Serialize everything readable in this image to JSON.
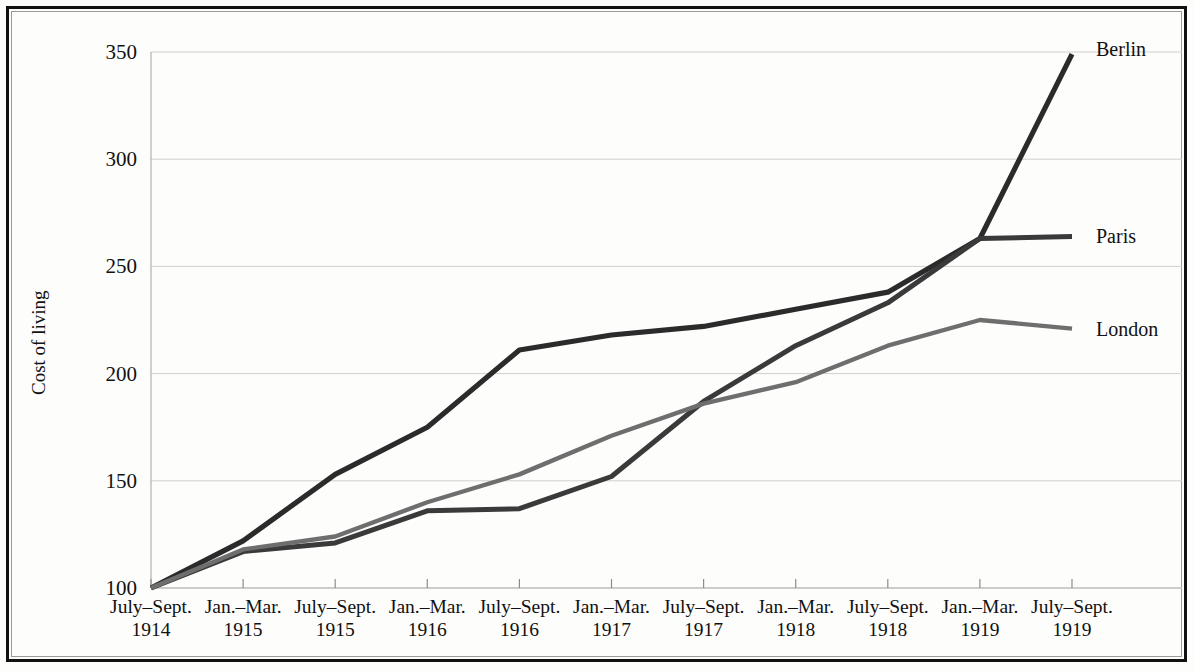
{
  "chart_data": {
    "type": "line",
    "title": "",
    "xlabel": "",
    "ylabel": "Cost of living",
    "ylim": [
      100,
      350
    ],
    "yticks": [
      100,
      150,
      200,
      250,
      300,
      350
    ],
    "grid": true,
    "legend_position": "right-inline-labels",
    "categories": [
      "July–Sept. 1914",
      "Jan.–Mar. 1915",
      "July–Sept. 1915",
      "Jan.–Mar. 1916",
      "July–Sept. 1916",
      "Jan.–Mar. 1917",
      "July–Sept. 1917",
      "Jan.–Mar. 1918",
      "July–Sept. 1918",
      "Jan.–Mar. 1919",
      "July–Sept. 1919"
    ],
    "categories_line1": [
      "July–Sept.",
      "Jan.–Mar.",
      "July–Sept.",
      "Jan.–Mar.",
      "July–Sept.",
      "Jan.–Mar.",
      "July–Sept.",
      "Jan.–Mar.",
      "July–Sept.",
      "Jan.–Mar.",
      "July–Sept."
    ],
    "categories_line2": [
      "1914",
      "1915",
      "1915",
      "1916",
      "1916",
      "1917",
      "1917",
      "1918",
      "1918",
      "1919",
      "1919"
    ],
    "series": [
      {
        "name": "Berlin",
        "color": "#2b2b2b",
        "values": [
          100,
          122,
          153,
          175,
          211,
          218,
          222,
          230,
          238,
          263,
          349
        ]
      },
      {
        "name": "Paris",
        "color": "#3a3a3a",
        "values": [
          100,
          117,
          121,
          136,
          137,
          152,
          187,
          213,
          233,
          263,
          264
        ]
      },
      {
        "name": "London",
        "color": "#6e6e6e",
        "values": [
          100,
          118,
          124,
          140,
          153,
          171,
          186,
          196,
          213,
          225,
          221
        ]
      }
    ]
  },
  "axis": {
    "y_title": "Cost of living",
    "y_tick_labels": [
      "100",
      "150",
      "200",
      "250",
      "300",
      "350"
    ]
  },
  "series_labels": [
    "Berlin",
    "Paris",
    "London"
  ],
  "colors": {
    "berlin": "#2b2b2b",
    "paris": "#3a3a3a",
    "london": "#6e6e6e",
    "grid": "#cfcfcb",
    "frame": "#111111",
    "background": "#fdfdfc"
  }
}
